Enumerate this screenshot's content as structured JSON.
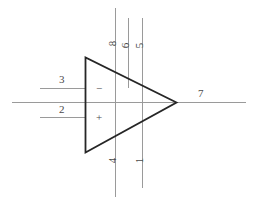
{
  "diagram": {
    "colors": {
      "background": "#ffffff",
      "body_stroke": "#262626",
      "wire_stroke": "#9a9a9a",
      "label_text": "#4a4a4a"
    },
    "amplifier": {
      "symbol": "triangle",
      "inverting_symbol": "−",
      "noninverting_symbol": "+"
    },
    "pins": [
      {
        "id": "pin-3",
        "number": "3",
        "side": "left",
        "orientation": "horizontal"
      },
      {
        "id": "pin-2",
        "number": "2",
        "side": "left",
        "orientation": "horizontal"
      },
      {
        "id": "pin-7",
        "number": "7",
        "side": "right",
        "orientation": "horizontal"
      },
      {
        "id": "pin-8",
        "number": "8",
        "side": "top",
        "orientation": "vertical"
      },
      {
        "id": "pin-6",
        "number": "6",
        "side": "top",
        "orientation": "vertical"
      },
      {
        "id": "pin-5",
        "number": "5",
        "side": "top",
        "orientation": "vertical"
      },
      {
        "id": "pin-4",
        "number": "4",
        "side": "bottom",
        "orientation": "vertical"
      },
      {
        "id": "pin-1",
        "number": "1",
        "side": "bottom",
        "orientation": "vertical"
      }
    ]
  }
}
